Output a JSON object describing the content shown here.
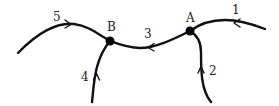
{
  "diagram": {
    "type": "directed-graph",
    "colors": {
      "stroke": "#111111",
      "node": "#000000",
      "text": "#222222",
      "background": "#ffffff"
    },
    "nodes": [
      {
        "id": "A",
        "label": "A"
      },
      {
        "id": "B",
        "label": "B"
      }
    ],
    "edges": [
      {
        "id": "1",
        "label": "1",
        "from": "external",
        "to": "A"
      },
      {
        "id": "2",
        "label": "2",
        "from": "external",
        "to": "A"
      },
      {
        "id": "3",
        "label": "3",
        "from": "A",
        "to": "B"
      },
      {
        "id": "4",
        "label": "4",
        "from": "external",
        "to": "B"
      },
      {
        "id": "5",
        "label": "5",
        "from": "B",
        "to": "external"
      }
    ]
  }
}
